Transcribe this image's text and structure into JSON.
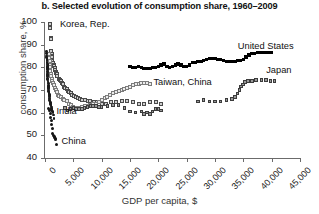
{
  "chart_data": {
    "type": "scatter",
    "title": "b. Selected evolution of consumption share, 1960–2009",
    "xlabel": "GDP per capita, $",
    "ylabel": "consumption share, %",
    "xlim": [
      0,
      45000
    ],
    "ylim": [
      40,
      100
    ],
    "xticks": [
      0,
      5000,
      10000,
      15000,
      20000,
      25000,
      30000,
      35000,
      40000,
      45000
    ],
    "xtick_labels": [
      "0",
      "5,000",
      "10,000",
      "15,000",
      "20,000",
      "25,000",
      "30,000",
      "35,000",
      "40,000",
      "45,000"
    ],
    "yticks": [
      40,
      50,
      60,
      70,
      80,
      90,
      100
    ],
    "ytick_labels": [
      "40",
      "50",
      "60",
      "70",
      "80",
      "90",
      "100"
    ],
    "grid": false,
    "legend": "in-plot annotations",
    "annotations": [
      {
        "text": "Korea, Rep.",
        "x": 2100,
        "y": 98.5
      },
      {
        "text": "United States",
        "x": 33500,
        "y": 89.0
      },
      {
        "text": "Taiwan, China",
        "x": 18600,
        "y": 73.0
      },
      {
        "text": "Japan",
        "x": 38500,
        "y": 78.5
      },
      {
        "text": "India",
        "x": 1500,
        "y": 60.5
      },
      {
        "text": "China",
        "x": 2400,
        "y": 47.0
      }
    ],
    "series": [
      {
        "name": "Korea, Rep.",
        "marker": "gray-outlined-square",
        "color": "#cfcfcf",
        "points": [
          [
            900,
            99.0
          ],
          [
            950,
            97.5
          ],
          [
            1000,
            93.0
          ],
          [
            1050,
            92.5
          ],
          [
            1100,
            87.0
          ],
          [
            1150,
            86.0
          ],
          [
            1200,
            85.0
          ],
          [
            1250,
            84.5
          ],
          [
            1300,
            83.0
          ],
          [
            1400,
            82.0
          ],
          [
            1500,
            81.0
          ],
          [
            1600,
            80.5
          ],
          [
            1700,
            79.5
          ],
          [
            1800,
            79.0
          ],
          [
            1900,
            78.0
          ],
          [
            2000,
            77.5
          ],
          [
            2100,
            77.0
          ],
          [
            2200,
            76.0
          ],
          [
            2400,
            75.0
          ],
          [
            2600,
            74.5
          ],
          [
            2800,
            74.0
          ],
          [
            3000,
            73.0
          ],
          [
            3200,
            72.5
          ],
          [
            3400,
            71.5
          ],
          [
            3600,
            71.0
          ],
          [
            3800,
            70.5
          ],
          [
            4000,
            69.5
          ],
          [
            4200,
            69.0
          ],
          [
            4500,
            68.5
          ],
          [
            4800,
            68.0
          ],
          [
            5100,
            67.5
          ],
          [
            5400,
            67.0
          ],
          [
            5800,
            66.5
          ],
          [
            6200,
            66.0
          ],
          [
            6600,
            65.5
          ],
          [
            7000,
            65.5
          ],
          [
            7500,
            65.0
          ],
          [
            8000,
            65.0
          ],
          [
            8600,
            64.5
          ],
          [
            9200,
            64.5
          ],
          [
            10000,
            64.0
          ],
          [
            10800,
            64.0
          ],
          [
            11600,
            64.5
          ],
          [
            12500,
            64.5
          ],
          [
            13500,
            65.0
          ],
          [
            14500,
            65.0
          ],
          [
            15500,
            64.5
          ],
          [
            16500,
            64.0
          ],
          [
            17500,
            64.0
          ],
          [
            18500,
            64.5
          ],
          [
            19500,
            64.5
          ],
          [
            20500,
            64.0
          ]
        ]
      },
      {
        "name": "Taiwan, China",
        "marker": "light-open-square",
        "color": "#ececec",
        "points": [
          [
            700,
            86.0
          ],
          [
            750,
            84.0
          ],
          [
            800,
            83.0
          ],
          [
            850,
            81.0
          ],
          [
            900,
            80.0
          ],
          [
            950,
            78.5
          ],
          [
            1000,
            77.0
          ],
          [
            1100,
            76.0
          ],
          [
            1200,
            75.0
          ],
          [
            1300,
            74.0
          ],
          [
            1400,
            73.0
          ],
          [
            1500,
            72.0
          ],
          [
            1700,
            71.0
          ],
          [
            1900,
            70.0
          ],
          [
            2100,
            69.0
          ],
          [
            2300,
            68.0
          ],
          [
            2500,
            67.5
          ],
          [
            2800,
            67.0
          ],
          [
            3100,
            66.0
          ],
          [
            3400,
            65.5
          ],
          [
            3800,
            65.0
          ],
          [
            4200,
            64.0
          ],
          [
            4600,
            63.5
          ],
          [
            5000,
            62.5
          ],
          [
            5500,
            62.0
          ],
          [
            6000,
            62.0
          ],
          [
            6500,
            62.5
          ],
          [
            7000,
            63.0
          ],
          [
            7500,
            63.0
          ],
          [
            8000,
            63.5
          ],
          [
            8500,
            64.0
          ],
          [
            9000,
            64.0
          ],
          [
            9500,
            64.5
          ],
          [
            10000,
            65.5
          ],
          [
            10500,
            66.5
          ],
          [
            11000,
            67.0
          ],
          [
            11500,
            68.0
          ],
          [
            12000,
            68.5
          ],
          [
            12500,
            69.0
          ],
          [
            13000,
            69.5
          ],
          [
            13500,
            70.0
          ],
          [
            14000,
            70.5
          ],
          [
            14500,
            71.0
          ],
          [
            15000,
            71.5
          ],
          [
            15500,
            72.0
          ],
          [
            16000,
            72.5
          ],
          [
            16500,
            72.5
          ],
          [
            17000,
            73.0
          ],
          [
            17500,
            73.0
          ],
          [
            18000,
            73.0
          ],
          [
            18500,
            72.5
          ]
        ]
      },
      {
        "name": "United States",
        "marker": "solid-black-square",
        "color": "#000000",
        "points": [
          [
            15000,
            80.5
          ],
          [
            15500,
            80.0
          ],
          [
            16000,
            80.0
          ],
          [
            16500,
            80.5
          ],
          [
            17000,
            80.0
          ],
          [
            17500,
            79.5
          ],
          [
            18000,
            79.5
          ],
          [
            18500,
            79.5
          ],
          [
            19000,
            80.0
          ],
          [
            19500,
            80.0
          ],
          [
            20000,
            80.5
          ],
          [
            20500,
            81.0
          ],
          [
            21000,
            81.5
          ],
          [
            21500,
            80.5
          ],
          [
            22000,
            80.0
          ],
          [
            22500,
            80.5
          ],
          [
            23000,
            81.0
          ],
          [
            23500,
            81.5
          ],
          [
            24000,
            81.0
          ],
          [
            24500,
            80.5
          ],
          [
            25000,
            80.5
          ],
          [
            25500,
            81.0
          ],
          [
            26000,
            82.0
          ],
          [
            26500,
            82.0
          ],
          [
            27000,
            82.5
          ],
          [
            27500,
            82.5
          ],
          [
            28000,
            83.0
          ],
          [
            28500,
            83.5
          ],
          [
            29000,
            84.0
          ],
          [
            29500,
            84.0
          ],
          [
            30000,
            84.0
          ],
          [
            30500,
            83.5
          ],
          [
            31000,
            83.5
          ],
          [
            31500,
            83.0
          ],
          [
            32000,
            82.5
          ],
          [
            32500,
            82.5
          ],
          [
            33000,
            82.5
          ],
          [
            33500,
            82.5
          ],
          [
            34000,
            83.0
          ],
          [
            34500,
            83.0
          ],
          [
            35000,
            83.5
          ],
          [
            35500,
            84.5
          ],
          [
            36000,
            85.5
          ],
          [
            36500,
            86.0
          ],
          [
            37000,
            86.0
          ],
          [
            37500,
            86.5
          ],
          [
            38000,
            86.5
          ],
          [
            38500,
            86.5
          ],
          [
            39000,
            86.5
          ],
          [
            39500,
            86.5
          ],
          [
            40000,
            86.5
          ]
        ]
      },
      {
        "name": "Japan",
        "marker": "gray-filled-square",
        "color": "#9a9a9a",
        "points": [
          [
            3500,
            62.0
          ],
          [
            4000,
            61.0
          ],
          [
            4500,
            61.5
          ],
          [
            5000,
            62.0
          ],
          [
            5500,
            61.5
          ],
          [
            6000,
            61.5
          ],
          [
            6500,
            61.5
          ],
          [
            7000,
            62.0
          ],
          [
            7500,
            62.5
          ],
          [
            8000,
            63.0
          ],
          [
            8500,
            63.0
          ],
          [
            9000,
            63.0
          ],
          [
            9500,
            62.5
          ],
          [
            10000,
            62.5
          ],
          [
            11000,
            63.0
          ],
          [
            12000,
            63.5
          ],
          [
            13000,
            63.5
          ],
          [
            14000,
            62.0
          ],
          [
            15000,
            60.5
          ],
          [
            16000,
            60.0
          ],
          [
            17000,
            60.5
          ],
          [
            17500,
            59.5
          ],
          [
            18000,
            60.0
          ],
          [
            18500,
            59.5
          ],
          [
            19000,
            60.5
          ],
          [
            19500,
            61.5
          ],
          [
            20000,
            61.5
          ],
          [
            20500,
            61.0
          ],
          [
            27000,
            65.0
          ],
          [
            28000,
            65.5
          ],
          [
            29000,
            65.0
          ],
          [
            30000,
            65.0
          ],
          [
            31000,
            65.0
          ],
          [
            32000,
            65.5
          ],
          [
            33000,
            66.0
          ],
          [
            33500,
            67.0
          ],
          [
            34000,
            68.5
          ],
          [
            34300,
            70.0
          ],
          [
            34600,
            71.5
          ],
          [
            34900,
            72.5
          ],
          [
            35300,
            73.5
          ],
          [
            35800,
            74.0
          ],
          [
            36500,
            74.0
          ],
          [
            37200,
            74.5
          ],
          [
            38200,
            74.5
          ],
          [
            39000,
            74.5
          ],
          [
            39800,
            74.0
          ],
          [
            40500,
            74.0
          ]
        ]
      },
      {
        "name": "India",
        "marker": "dark-dot",
        "color": "#1a1a1a",
        "points": [
          [
            300,
            87.0
          ],
          [
            310,
            86.0
          ],
          [
            320,
            85.0
          ],
          [
            330,
            84.5
          ],
          [
            340,
            84.0
          ],
          [
            350,
            83.5
          ],
          [
            360,
            83.0
          ],
          [
            370,
            82.0
          ],
          [
            380,
            81.5
          ],
          [
            390,
            81.0
          ],
          [
            400,
            80.5
          ],
          [
            410,
            80.0
          ],
          [
            420,
            79.5
          ],
          [
            430,
            79.0
          ],
          [
            440,
            78.0
          ],
          [
            450,
            77.5
          ],
          [
            460,
            77.0
          ],
          [
            470,
            76.5
          ],
          [
            480,
            76.0
          ],
          [
            490,
            75.0
          ],
          [
            500,
            74.5
          ],
          [
            520,
            74.0
          ],
          [
            540,
            73.5
          ],
          [
            560,
            73.0
          ],
          [
            580,
            72.0
          ],
          [
            600,
            71.5
          ],
          [
            620,
            71.0
          ],
          [
            640,
            70.5
          ],
          [
            660,
            70.0
          ],
          [
            680,
            69.5
          ],
          [
            700,
            69.0
          ],
          [
            720,
            68.5
          ],
          [
            740,
            68.0
          ],
          [
            760,
            67.5
          ],
          [
            780,
            67.0
          ],
          [
            800,
            66.5
          ],
          [
            830,
            66.0
          ],
          [
            860,
            65.5
          ],
          [
            890,
            65.0
          ],
          [
            920,
            64.5
          ],
          [
            950,
            64.0
          ],
          [
            1000,
            63.5
          ],
          [
            1050,
            63.0
          ],
          [
            1100,
            62.5
          ],
          [
            1150,
            62.0
          ],
          [
            1200,
            61.5
          ],
          [
            1250,
            61.0
          ],
          [
            1300,
            60.5
          ],
          [
            1400,
            60.0
          ],
          [
            1500,
            59.0
          ],
          [
            1600,
            57.5
          ]
        ]
      },
      {
        "name": "China",
        "marker": "dark-dot",
        "color": "#141414",
        "points": [
          [
            700,
            62.0
          ],
          [
            800,
            61.0
          ],
          [
            900,
            59.5
          ],
          [
            1000,
            58.0
          ],
          [
            1100,
            56.5
          ],
          [
            1200,
            55.0
          ],
          [
            1300,
            53.0
          ],
          [
            1400,
            51.0
          ],
          [
            1500,
            50.0
          ],
          [
            1600,
            49.5
          ],
          [
            1700,
            49.0
          ],
          [
            1800,
            48.5
          ],
          [
            1900,
            48.0
          ],
          [
            2000,
            46.0
          ]
        ]
      }
    ]
  }
}
